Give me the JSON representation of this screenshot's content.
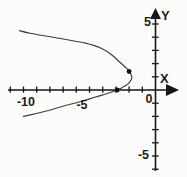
{
  "figure": {
    "type": "math-plot",
    "background": "#fcfcfb",
    "axis_color": "#161616",
    "curve_color": "#3d3d3d",
    "point_color": "#101010",
    "labels": {
      "x_axis": "X",
      "y_axis": "Y",
      "x_tick_labels": [
        "-10",
        "-5",
        "0"
      ],
      "y_tick_labels": [
        "5",
        "-5"
      ]
    }
  },
  "chart_data": {
    "type": "line",
    "title": "",
    "xlabel": "X",
    "ylabel": "Y",
    "xlim": [
      -11.7,
      2.4
    ],
    "ylim": [
      -6.6,
      6.8
    ],
    "grid": false,
    "x_tick_step": 1,
    "x_tick_range": [
      -11,
      -1
    ],
    "y_tick_range": [
      -6,
      5
    ],
    "x_labeled_ticks": [
      -10,
      -5,
      0
    ],
    "y_labeled_ticks": [
      5,
      -5
    ],
    "series": [
      {
        "name": "left-opening-parabola",
        "points": [
          [
            -10.3,
            4.5
          ],
          [
            -9.5,
            4.3
          ],
          [
            -7.2,
            3.9
          ],
          [
            -5.3,
            3.55
          ],
          [
            -4.2,
            3.2
          ],
          [
            -3.3,
            2.65
          ],
          [
            -2.7,
            2.1
          ],
          [
            -2.2,
            1.65
          ],
          [
            -2.0,
            1.4
          ],
          [
            -1.8,
            1.05
          ],
          [
            -1.85,
            0.75
          ],
          [
            -2.1,
            0.45
          ],
          [
            -2.5,
            0.2
          ],
          [
            -2.9,
            0.0
          ],
          [
            -3.6,
            -0.25
          ],
          [
            -4.6,
            -0.55
          ],
          [
            -5.6,
            -0.85
          ],
          [
            -6.9,
            -1.2
          ],
          [
            -8.1,
            -1.55
          ],
          [
            -9.1,
            -1.8
          ],
          [
            -10.0,
            -2.0
          ]
        ]
      }
    ],
    "marked_points": [
      {
        "name": "vertex-point",
        "x": -2.0,
        "y": 1.4
      },
      {
        "name": "x-intercept-point",
        "x": -2.9,
        "y": 0.0
      }
    ],
    "layout": {
      "width": 187,
      "height": 177,
      "origin_px": [
        155.5,
        90
      ],
      "unit_px": 13.2,
      "x_axis_px": {
        "x1": 8,
        "x2": 167,
        "arrow_tip": 179,
        "arrow_base": 166,
        "arrow_half": 6
      },
      "y_axis_px": {
        "y1": 19,
        "y2": 171,
        "arrow_tip": 8,
        "arrow_base": 19,
        "arrow_half": 5.5
      },
      "tick_half_px": {
        "x_up": 3.5,
        "x_down": 2.8,
        "y_left": 3.6,
        "y_right": 3.2
      },
      "point_radius_px": 2.4,
      "tick_labels": [
        {
          "name": "x-tick-label-neg10",
          "text": "-10",
          "px": 26,
          "py": 106,
          "anchor": "middle",
          "size": 12.5
        },
        {
          "name": "x-tick-label-neg5",
          "text": "-5",
          "px": 82,
          "py": 109,
          "anchor": "middle",
          "size": 12.5
        },
        {
          "name": "x-tick-label-0",
          "text": "0",
          "px": 149,
          "py": 103,
          "anchor": "middle",
          "size": 12.5
        },
        {
          "name": "y-tick-label-5",
          "text": "5",
          "px": 151,
          "py": 26,
          "anchor": "end",
          "size": 12.5
        },
        {
          "name": "y-tick-label-neg5",
          "text": "-5",
          "px": 149,
          "py": 159,
          "anchor": "end",
          "size": 12.5
        },
        {
          "name": "x-axis-label",
          "text": "X",
          "px": 160,
          "py": 83,
          "anchor": "start",
          "size": 13
        },
        {
          "name": "y-axis-label",
          "text": "Y",
          "px": 161,
          "py": 20,
          "anchor": "start",
          "size": 13
        }
      ]
    }
  }
}
